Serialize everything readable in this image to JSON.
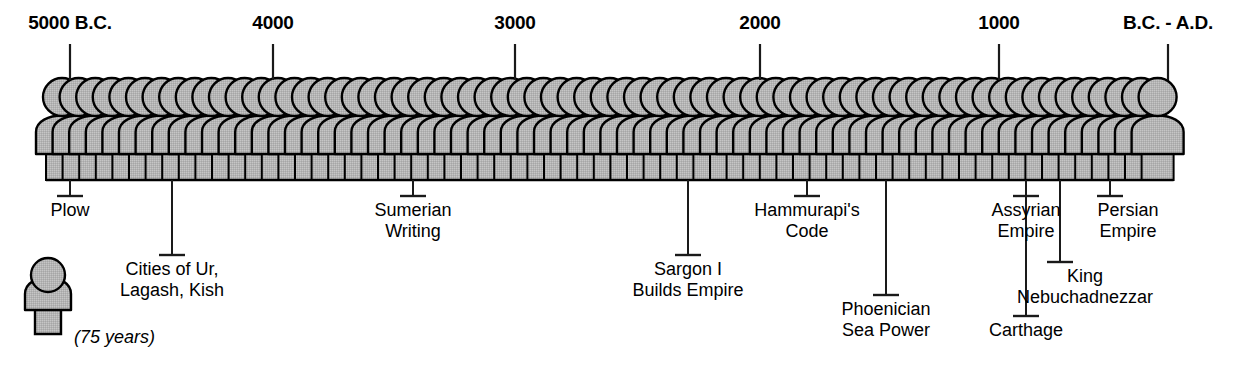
{
  "diagram": {
    "colors": {
      "figure_fill": "#b4b4b4",
      "outline": "#000000",
      "background": "#ffffff",
      "leader_line": "#1a1a1a"
    },
    "axis": {
      "ticks": [
        {
          "label": "5000 B.C.",
          "x": 70
        },
        {
          "label": "4000",
          "x": 273
        },
        {
          "label": "3000",
          "x": 515
        },
        {
          "label": "2000",
          "x": 760
        },
        {
          "label": "1000",
          "x": 999
        },
        {
          "label": "B.C. - A.D.",
          "x": 1168
        }
      ]
    },
    "figures": {
      "count": 67,
      "start_x": 62,
      "pitch": 16.6,
      "head_radius": 19,
      "body_top_y": 118,
      "base_top_y": 152,
      "base_bottom_y": 180
    },
    "annotations": [
      {
        "name": "plow",
        "text": "Plow",
        "anchor_x": 70,
        "stem_bottom_y": 196,
        "label_y": 200,
        "label_x": 70
      },
      {
        "name": "cities-ur",
        "text": "Cities of Ur,\nLagash, Kish",
        "anchor_x": 172,
        "stem_bottom_y": 255,
        "label_y": 259,
        "label_x": 172
      },
      {
        "name": "sumerian-writing",
        "text": "Sumerian\nWriting",
        "anchor_x": 413,
        "stem_bottom_y": 196,
        "label_y": 200,
        "label_x": 413
      },
      {
        "name": "sargon-i",
        "text": "Sargon I\nBuilds Empire",
        "anchor_x": 688,
        "stem_bottom_y": 255,
        "label_y": 259,
        "label_x": 688
      },
      {
        "name": "hammurapis-code",
        "text": "Hammurapi's\nCode",
        "anchor_x": 807,
        "stem_bottom_y": 196,
        "label_y": 200,
        "label_x": 807
      },
      {
        "name": "phoenician",
        "text": "Phoenician\nSea Power",
        "anchor_x": 886,
        "stem_bottom_y": 295,
        "label_y": 299,
        "label_x": 886
      },
      {
        "name": "assyrian-empire",
        "text": "Assyrian\nEmpire",
        "anchor_x": 1026,
        "stem_bottom_y": 196,
        "label_y": 200,
        "label_x": 1026
      },
      {
        "name": "king-nebuchadnezzar",
        "text": "King\nNebuchadnezzar",
        "anchor_x": 1060,
        "stem_bottom_y": 262,
        "label_y": 266,
        "label_x": 1085
      },
      {
        "name": "carthage",
        "text": "Carthage",
        "anchor_x": 1026,
        "stem_bottom_y": 316,
        "label_y": 320,
        "label_x": 1026
      },
      {
        "name": "persian-empire",
        "text": "Persian\nEmpire",
        "anchor_x": 1110,
        "stem_bottom_y": 196,
        "label_y": 200,
        "label_x": 1128
      }
    ],
    "legend": {
      "caption": "(75 years)",
      "caption_x": 74,
      "caption_y": 327,
      "figure_x": 48,
      "figure_y": 268
    }
  }
}
